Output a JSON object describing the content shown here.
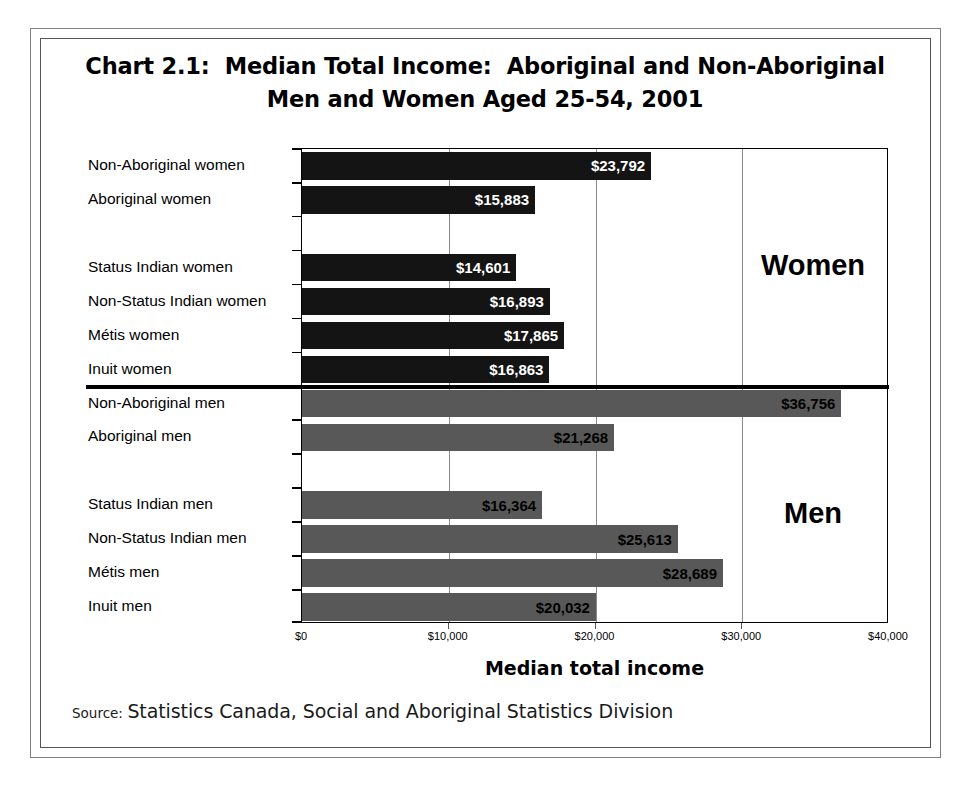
{
  "chart_data": {
    "type": "bar",
    "orientation": "horizontal",
    "title": "Chart 2.1:  Median Total Income:  Aboriginal and Non-Aboriginal Men and Women Aged 25-54, 2001",
    "title_lines": [
      "Chart 2.1:  Median Total Income:  Aboriginal and Non-Aboriginal",
      "Men and Women Aged 25-54, 2001"
    ],
    "xlabel": "Median total income",
    "ylabel": "",
    "xlim": [
      0,
      40000
    ],
    "xticks": [
      0,
      10000,
      20000,
      30000,
      40000
    ],
    "xtick_labels": [
      "$0",
      "$10,000",
      "$20,000",
      "$30,000",
      "$40,000"
    ],
    "grid": "vertical",
    "legend": "none",
    "sections": [
      {
        "name": "Women",
        "label": "Women",
        "color": "#141414",
        "categories": [
          "Non-Aboriginal women",
          "Aboriginal women",
          "",
          "Status Indian women",
          "Non-Status Indian women",
          "Métis women",
          "Inuit women"
        ],
        "values": [
          23792,
          15883,
          null,
          14601,
          16893,
          17865,
          16863
        ],
        "value_labels": [
          "$23,792",
          "$15,883",
          "",
          "$14,601",
          "$16,893",
          "$17,865",
          "$16,863"
        ]
      },
      {
        "name": "Men",
        "label": "Men",
        "color": "#585858",
        "categories": [
          "Non-Aboriginal men",
          "Aboriginal men",
          "",
          "Status Indian men",
          "Non-Status Indian men",
          "Métis men",
          "Inuit men"
        ],
        "values": [
          36756,
          21268,
          null,
          16364,
          25613,
          28689,
          20032
        ],
        "value_labels": [
          "$36,756",
          "$21,268",
          "",
          "$16,364",
          "$25,613",
          "$28,689",
          "$20,032"
        ]
      }
    ],
    "colors": {
      "women_bar": "#141414",
      "men_bar": "#585858",
      "axis": "#000000",
      "gridline": "#8a8a8a",
      "background": "#ffffff"
    }
  },
  "source": {
    "label": "Source:",
    "text": "Statistics Canada, Social and Aboriginal Statistics Division"
  }
}
